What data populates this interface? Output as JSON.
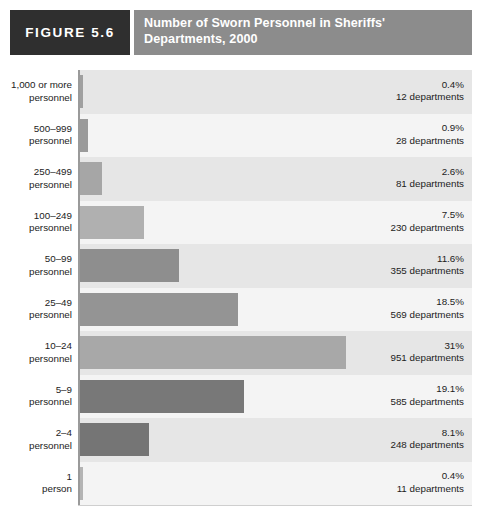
{
  "figure": {
    "badge_label": "FIGURE 5.6",
    "title": "Number of Sworn Personnel in Sheriffs'\nDepartments, 2000"
  },
  "colors": {
    "badge_background": "#2f2f2f",
    "title_background": "#8c8c8c",
    "plot_background": "#f2f2f2",
    "band_dark": "#e6e6e6",
    "band_light": "#f4f4f4",
    "gridline": "#ffffff",
    "axis": "#9a9a9a",
    "bar_light": "#a8a8a8",
    "bar_medium": "#909090",
    "bar_dark": "#787878",
    "text": "#1c1c1c"
  },
  "chart_data": {
    "type": "bar",
    "orientation": "horizontal",
    "title": "Number of Sworn Personnel in Sheriffs' Departments, 2000",
    "xlabel": "",
    "ylabel": "",
    "xlim": [
      0,
      46
    ],
    "grid": true,
    "gridline_values": [
      5,
      10,
      15,
      20,
      25,
      30,
      35,
      40,
      45
    ],
    "legend": "none",
    "categories": [
      "1,000 or more personnel",
      "500–999 personnel",
      "250–499 personnel",
      "100–249 personnel",
      "50–99 personnel",
      "25–49 personnel",
      "10–24 personnel",
      "5–9 personnel",
      "2–4 personnel",
      "1 person"
    ],
    "values": [
      0.4,
      0.9,
      2.6,
      7.5,
      11.6,
      18.5,
      31,
      19.1,
      8.1,
      0.4
    ],
    "counts": [
      12,
      28,
      81,
      230,
      355,
      569,
      951,
      585,
      248,
      11
    ],
    "rows": [
      {
        "category_line1": "1,000 or more",
        "category_line2": "personnel",
        "percent": 0.4,
        "percent_label": "0.4%",
        "count": 12,
        "count_label": "12 departments",
        "bar_color": "#a0a0a0"
      },
      {
        "category_line1": "500–999",
        "category_line2": "personnel",
        "percent": 0.9,
        "percent_label": "0.9%",
        "count": 28,
        "count_label": "28 departments",
        "bar_color": "#9a9a9a"
      },
      {
        "category_line1": "250–499",
        "category_line2": "personnel",
        "percent": 2.6,
        "percent_label": "2.6%",
        "count": 81,
        "count_label": "81 departments",
        "bar_color": "#a6a6a6"
      },
      {
        "category_line1": "100–249",
        "category_line2": "personnel",
        "percent": 7.5,
        "percent_label": "7.5%",
        "count": 230,
        "count_label": "230 departments",
        "bar_color": "#b0b0b0"
      },
      {
        "category_line1": "50–99",
        "category_line2": "personnel",
        "percent": 11.6,
        "percent_label": "11.6%",
        "count": 355,
        "count_label": "355 departments",
        "bar_color": "#8e8e8e"
      },
      {
        "category_line1": "25–49",
        "category_line2": "personnel",
        "percent": 18.5,
        "percent_label": "18.5%",
        "count": 569,
        "count_label": "569 departments",
        "bar_color": "#949494"
      },
      {
        "category_line1": "10–24",
        "category_line2": "personnel",
        "percent": 31,
        "percent_label": "31%",
        "count": 951,
        "count_label": "951 departments",
        "bar_color": "#a8a8a8"
      },
      {
        "category_line1": "5–9",
        "category_line2": "personnel",
        "percent": 19.1,
        "percent_label": "19.1%",
        "count": 585,
        "count_label": "585 departments",
        "bar_color": "#787878"
      },
      {
        "category_line1": "2–4",
        "category_line2": "personnel",
        "percent": 8.1,
        "percent_label": "8.1%",
        "count": 248,
        "count_label": "248 departments",
        "bar_color": "#757575"
      },
      {
        "category_line1": "1",
        "category_line2": "person",
        "percent": 0.4,
        "percent_label": "0.4%",
        "count": 11,
        "count_label": "11 departments",
        "bar_color": "#b4b4b4"
      }
    ]
  }
}
